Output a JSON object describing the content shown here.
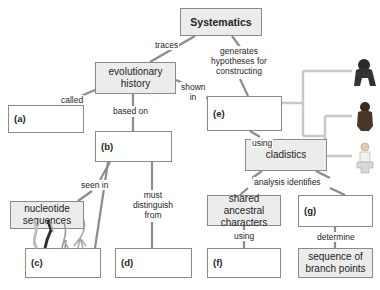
{
  "title": "Systematics",
  "nodes": {
    "systematics": "Systematics",
    "evolutionary_history": "evolutionary history",
    "a": "(a)",
    "b": "(b)",
    "nucleotide_sequences": "nucleotide sequences",
    "c": "(c)",
    "d": "(d)",
    "e": "(e)",
    "cladistics": "cladistics",
    "shared_ancestral_characters": "shared ancestral characters",
    "f": "(f)",
    "g": "(g)",
    "sequence_of_branch_points": "sequence of branch points"
  },
  "links": {
    "traces": "traces",
    "generates": "generates hypotheses for constructing",
    "called": "called",
    "shown_in": "shown in",
    "based_on": "based on",
    "seen_in": "seen in",
    "must_distinguish": "must distinguish from",
    "using_e": "using",
    "analysis_identifies": "analysis identifies",
    "using_f": "using",
    "determine": "determine"
  },
  "images": {
    "cladogram_taxa": [
      "gorilla",
      "chimpanzee",
      "human"
    ],
    "homologous_limbs": [
      "limb-1",
      "limb-2",
      "limb-3",
      "limb-4"
    ]
  },
  "colors": {
    "filled_box": "#ececec",
    "border": "#8a8a8a",
    "connector": "#8c8c8c",
    "cladogram": "#c8c8c8"
  }
}
